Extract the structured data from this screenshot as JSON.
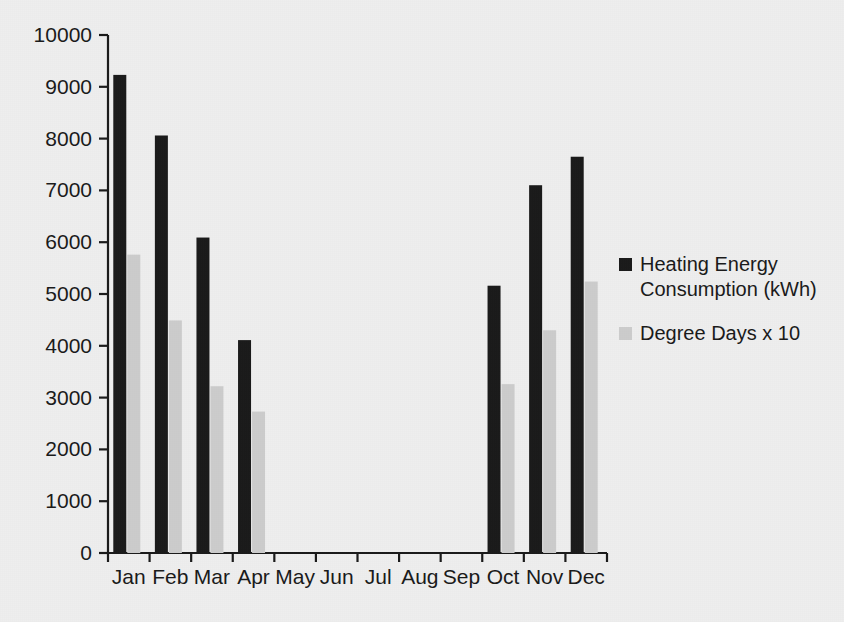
{
  "chart_data": {
    "type": "bar",
    "title": "",
    "subtitle": "",
    "xlabel": "",
    "ylabel": "",
    "categories": [
      "Jan",
      "Feb",
      "Mar",
      "Apr",
      "May",
      "Jun",
      "Jul",
      "Aug",
      "Sep",
      "Oct",
      "Nov",
      "Dec"
    ],
    "series": [
      {
        "name": "Heating Energy Consumption (kWh)",
        "color": "#1a1a1a",
        "values": [
          9230,
          8060,
          6090,
          4110,
          0,
          0,
          0,
          0,
          0,
          5160,
          7100,
          7650
        ]
      },
      {
        "name": "Degree Days x 10",
        "color": "#cccccc",
        "values": [
          5760,
          4490,
          3220,
          2730,
          0,
          0,
          0,
          0,
          0,
          3260,
          4300,
          5240
        ]
      }
    ],
    "ylim": [
      0,
      10000
    ],
    "y_ticks": [
      0,
      1000,
      2000,
      3000,
      4000,
      5000,
      6000,
      7000,
      8000,
      9000,
      10000
    ],
    "y_tick_labels": [
      "0",
      "1000",
      "2000",
      "3000",
      "4000",
      "5000",
      "6000",
      "7000",
      "8000",
      "9000",
      "10000"
    ],
    "grid": false,
    "legend_position": "right",
    "legend": [
      {
        "label_line1": "Heating Energy",
        "label_line2": "Consumption (kWh)",
        "swatch": "#1a1a1a"
      },
      {
        "label_line1": "Degree Days x 10",
        "label_line2": "",
        "swatch": "#cccccc"
      }
    ],
    "background_color": "#eeeeee",
    "axis_color": "#1a1a1a"
  }
}
